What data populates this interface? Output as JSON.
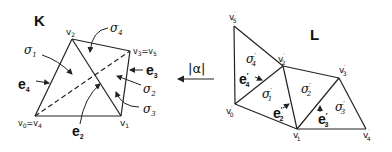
{
  "complex_K": {
    "title": "K",
    "vertices": {
      "v0": "v0=v4",
      "v1": "v1",
      "v2": "v2",
      "v3": "v3=v5"
    },
    "simplices": [
      "σ1",
      "σ2",
      "σ3",
      "σ4"
    ],
    "edges": [
      "e2",
      "e3",
      "e4"
    ]
  },
  "map": {
    "label": "|α|"
  },
  "complex_L": {
    "title": "L",
    "vertices": {
      "v0": "v0'",
      "v1": "v1'",
      "v2": "v2'",
      "v3": "v3'",
      "v4": "v4'",
      "v5": "v5'"
    },
    "simplices": [
      "σ1'",
      "σ2'",
      "σ3'",
      "σ4'"
    ],
    "edges": [
      "e2'",
      "e3'",
      "e4'"
    ]
  },
  "colors": {
    "line": "#222222",
    "background": "#ffffff"
  }
}
